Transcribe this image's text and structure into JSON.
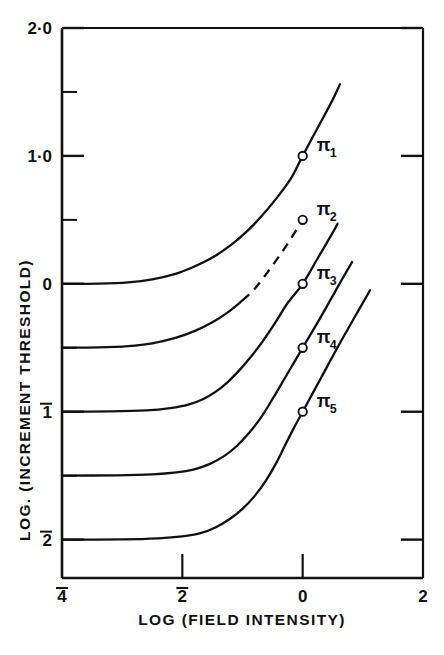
{
  "chart_data": {
    "type": "line",
    "title": "",
    "xlabel": "LOG (FIELD INTENSITY)",
    "ylabel": "LOG. (INCREMENT THRESHOLD)",
    "xlim": [
      -4,
      2
    ],
    "ylim": [
      -2.3,
      2.0
    ],
    "grid": false,
    "legend_position": "inline-right-of-curve",
    "x_ticks": [
      {
        "value": -4,
        "label": "4",
        "overbar": true
      },
      {
        "value": -2,
        "label": "2",
        "overbar": true
      },
      {
        "value": 0,
        "label": "0",
        "overbar": false
      },
      {
        "value": 2,
        "label": "2",
        "overbar": false
      }
    ],
    "y_ticks": [
      {
        "value": 2.0,
        "label": "2·0",
        "overbar": false,
        "major": true
      },
      {
        "value": 1.5,
        "label": "",
        "overbar": false,
        "major": false
      },
      {
        "value": 1.0,
        "label": "1·0",
        "overbar": false,
        "major": true
      },
      {
        "value": 0.5,
        "label": "",
        "overbar": false,
        "major": false
      },
      {
        "value": 0.0,
        "label": "0",
        "overbar": false,
        "major": true
      },
      {
        "value": -0.5,
        "label": "",
        "overbar": false,
        "major": false
      },
      {
        "value": -1.0,
        "label": "1",
        "overbar": true,
        "major": true
      },
      {
        "value": -1.5,
        "label": "",
        "overbar": false,
        "major": false
      },
      {
        "value": -2.0,
        "label": "2",
        "overbar": true,
        "major": true
      }
    ],
    "series": [
      {
        "name": "π₁",
        "label_text": "π",
        "label_sub": "1",
        "asymptote": 0.0,
        "marker_point": {
          "x": 0.0,
          "y": 1.0
        },
        "dashed": false,
        "points": [
          {
            "x": -4.0,
            "y": 0.0
          },
          {
            "x": -3.4,
            "y": 0.002
          },
          {
            "x": -2.9,
            "y": 0.012
          },
          {
            "x": -2.5,
            "y": 0.035
          },
          {
            "x": -2.1,
            "y": 0.08
          },
          {
            "x": -1.8,
            "y": 0.135
          },
          {
            "x": -1.5,
            "y": 0.205
          },
          {
            "x": -1.2,
            "y": 0.3
          },
          {
            "x": -0.95,
            "y": 0.4
          },
          {
            "x": -0.7,
            "y": 0.52
          },
          {
            "x": -0.45,
            "y": 0.66
          },
          {
            "x": -0.2,
            "y": 0.82
          },
          {
            "x": 0.0,
            "y": 1.0
          },
          {
            "x": 0.25,
            "y": 1.22
          },
          {
            "x": 0.5,
            "y": 1.44
          },
          {
            "x": 0.62,
            "y": 1.56
          }
        ]
      },
      {
        "name": "π₂",
        "label_text": "π",
        "label_sub": "2",
        "asymptote": -0.5,
        "marker_point": {
          "x": 0.0,
          "y": 0.5
        },
        "dashed": true,
        "dash_start_x": -1.0,
        "points": [
          {
            "x": -4.0,
            "y": -0.5
          },
          {
            "x": -3.4,
            "y": -0.497
          },
          {
            "x": -2.9,
            "y": -0.487
          },
          {
            "x": -2.5,
            "y": -0.465
          },
          {
            "x": -2.1,
            "y": -0.42
          },
          {
            "x": -1.8,
            "y": -0.37
          },
          {
            "x": -1.5,
            "y": -0.3
          },
          {
            "x": -1.25,
            "y": -0.225
          },
          {
            "x": -1.0,
            "y": -0.13
          },
          {
            "x": -0.8,
            "y": -0.04
          },
          {
            "x": -0.6,
            "y": 0.08
          },
          {
            "x": -0.4,
            "y": 0.21
          },
          {
            "x": -0.2,
            "y": 0.35
          },
          {
            "x": 0.0,
            "y": 0.5
          }
        ]
      },
      {
        "name": "π₃",
        "label_text": "π",
        "label_sub": "3",
        "asymptote": -1.0,
        "marker_point": {
          "x": 0.0,
          "y": 0.0
        },
        "dashed": false,
        "points": [
          {
            "x": -4.0,
            "y": -1.0
          },
          {
            "x": -3.2,
            "y": -0.998
          },
          {
            "x": -2.6,
            "y": -0.99
          },
          {
            "x": -2.2,
            "y": -0.972
          },
          {
            "x": -1.9,
            "y": -0.945
          },
          {
            "x": -1.65,
            "y": -0.9
          },
          {
            "x": -1.45,
            "y": -0.845
          },
          {
            "x": -1.25,
            "y": -0.77
          },
          {
            "x": -1.05,
            "y": -0.675
          },
          {
            "x": -0.85,
            "y": -0.565
          },
          {
            "x": -0.65,
            "y": -0.44
          },
          {
            "x": -0.45,
            "y": -0.3
          },
          {
            "x": -0.25,
            "y": -0.15
          },
          {
            "x": 0.0,
            "y": 0.0
          },
          {
            "x": 0.25,
            "y": 0.2
          },
          {
            "x": 0.5,
            "y": 0.4
          },
          {
            "x": 0.58,
            "y": 0.47
          }
        ]
      },
      {
        "name": "π₄",
        "label_text": "π",
        "label_sub": "4",
        "asymptote": -1.5,
        "marker_point": {
          "x": 0.0,
          "y": -0.5
        },
        "dashed": false,
        "points": [
          {
            "x": -4.0,
            "y": -1.5
          },
          {
            "x": -3.1,
            "y": -1.497
          },
          {
            "x": -2.5,
            "y": -1.49
          },
          {
            "x": -2.1,
            "y": -1.475
          },
          {
            "x": -1.8,
            "y": -1.45
          },
          {
            "x": -1.55,
            "y": -1.41
          },
          {
            "x": -1.3,
            "y": -1.345
          },
          {
            "x": -1.1,
            "y": -1.27
          },
          {
            "x": -0.9,
            "y": -1.17
          },
          {
            "x": -0.7,
            "y": -1.05
          },
          {
            "x": -0.5,
            "y": -0.9
          },
          {
            "x": -0.3,
            "y": -0.74
          },
          {
            "x": -0.15,
            "y": -0.62
          },
          {
            "x": 0.0,
            "y": -0.5
          },
          {
            "x": 0.3,
            "y": -0.26
          },
          {
            "x": 0.6,
            "y": -0.01
          },
          {
            "x": 0.82,
            "y": 0.17
          }
        ]
      },
      {
        "name": "π₅",
        "label_text": "π",
        "label_sub": "5",
        "asymptote": -2.0,
        "marker_point": {
          "x": 0.0,
          "y": -1.0
        },
        "dashed": false,
        "points": [
          {
            "x": -4.0,
            "y": -2.0
          },
          {
            "x": -3.0,
            "y": -1.998
          },
          {
            "x": -2.4,
            "y": -1.99
          },
          {
            "x": -2.0,
            "y": -1.975
          },
          {
            "x": -1.7,
            "y": -1.95
          },
          {
            "x": -1.45,
            "y": -1.905
          },
          {
            "x": -1.2,
            "y": -1.835
          },
          {
            "x": -1.0,
            "y": -1.76
          },
          {
            "x": -0.8,
            "y": -1.66
          },
          {
            "x": -0.6,
            "y": -1.53
          },
          {
            "x": -0.45,
            "y": -1.41
          },
          {
            "x": -0.3,
            "y": -1.27
          },
          {
            "x": -0.15,
            "y": -1.13
          },
          {
            "x": 0.0,
            "y": -1.0
          },
          {
            "x": 0.3,
            "y": -0.74
          },
          {
            "x": 0.6,
            "y": -0.48
          },
          {
            "x": 0.95,
            "y": -0.19
          },
          {
            "x": 1.12,
            "y": -0.05
          }
        ]
      }
    ],
    "marker_style": "open-circle",
    "colors": {
      "ink": "#111111",
      "background": "#ffffff"
    }
  }
}
